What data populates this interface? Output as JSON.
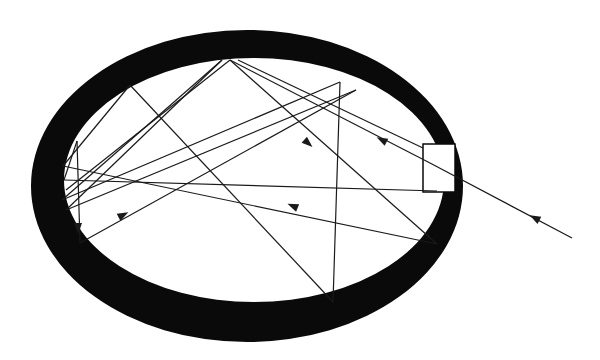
{
  "diagram": {
    "colors": {
      "background": "#ffffff",
      "wall": "#0a0a0a",
      "ray": "#1a1a1a",
      "port": "#ffffff"
    },
    "cavity": {
      "outer": {
        "cx": 247,
        "cy": 186,
        "rx": 216,
        "ry": 156
      },
      "inner": {
        "cx": 254,
        "cy": 180,
        "rx": 190,
        "ry": 122
      }
    },
    "port": {
      "x": 423,
      "y": 144,
      "w": 32,
      "h": 48
    },
    "rays": [
      [
        572,
        238,
        430,
        163
      ],
      [
        430,
        163,
        230,
        60
      ],
      [
        230,
        60,
        437,
        244
      ],
      [
        437,
        244,
        63,
        166
      ],
      [
        63,
        166,
        130,
        85
      ],
      [
        130,
        85,
        333,
        302
      ],
      [
        333,
        302,
        340,
        82
      ],
      [
        340,
        82,
        62,
        200
      ],
      [
        62,
        200,
        222,
        60
      ],
      [
        222,
        60,
        66,
        210
      ],
      [
        66,
        210,
        356,
        90
      ],
      [
        356,
        90,
        80,
        243
      ],
      [
        80,
        243,
        77,
        141
      ],
      [
        77,
        141,
        64,
        180
      ],
      [
        64,
        180,
        437,
        191
      ],
      [
        230,
        60,
        66,
        190
      ],
      [
        238,
        60,
        423,
        148
      ]
    ],
    "arrows": [
      {
        "x": 535,
        "y": 218,
        "angle": 208
      },
      {
        "x": 382,
        "y": 140,
        "angle": 207
      },
      {
        "x": 308,
        "y": 143,
        "angle": 42
      },
      {
        "x": 293,
        "y": 206,
        "angle": 203
      },
      {
        "x": 123,
        "y": 215,
        "angle": -28
      },
      {
        "x": 78,
        "y": 228,
        "angle": 90
      }
    ]
  }
}
